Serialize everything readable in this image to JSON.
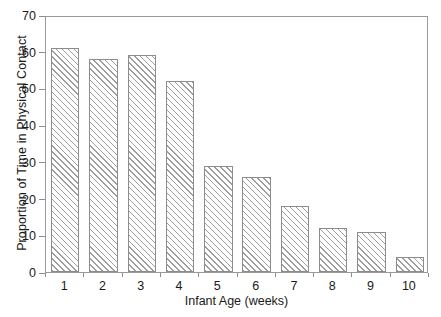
{
  "chart_data": {
    "type": "bar",
    "title": "",
    "xlabel": "Infant Age (weeks)",
    "ylabel": "Proportion of Time in Physical Contact",
    "categories": [
      "1",
      "2",
      "3",
      "4",
      "5",
      "6",
      "7",
      "8",
      "9",
      "10"
    ],
    "values": [
      61,
      58,
      59,
      52,
      29,
      26,
      18,
      12,
      11,
      4
    ],
    "ylim": [
      0,
      70
    ],
    "ytick_labels": [
      "0",
      "10",
      "20",
      "30",
      "40",
      "50",
      "60",
      "70"
    ],
    "ytick_values": [
      0,
      10,
      20,
      30,
      40,
      50,
      60,
      70
    ],
    "grid": false,
    "legend": false,
    "legend_position": "none",
    "series": [
      {
        "name": "Proportion of Time in Physical Contact",
        "values": [
          61,
          58,
          59,
          52,
          29,
          26,
          18,
          12,
          11,
          4
        ],
        "fill": "hatched-diagonal",
        "color": "#9d9d9d",
        "edge_color": "#8c8c8c"
      }
    ],
    "colors": {
      "axis": "#9a9a9a",
      "text": "#1a1a1a",
      "bar_hatch": "#9d9d9d",
      "bar_edge": "#8c8c8c",
      "background": "#ffffff"
    }
  }
}
